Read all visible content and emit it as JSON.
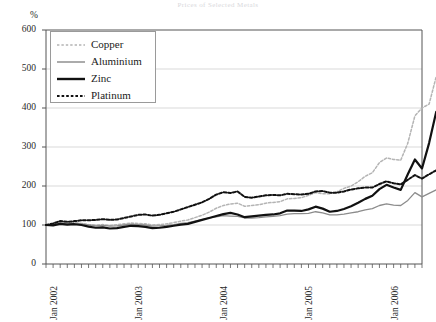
{
  "figure": {
    "title": "Prices of Selected Metals",
    "unit_label": "%"
  },
  "chart_data": {
    "type": "line",
    "title": "Prices of Selected Metals",
    "xlabel": "",
    "ylabel": "%",
    "ylim": [
      0,
      600
    ],
    "yticks": [
      0,
      100,
      200,
      300,
      400,
      500,
      600
    ],
    "ytick_labels": [
      "0",
      "100",
      "200",
      "300",
      "400",
      "500",
      "600"
    ],
    "gridlines": [
      100,
      200,
      300,
      400,
      500
    ],
    "grid": true,
    "legend_position": "upper-left",
    "x_tick_interval_months": 1,
    "x_axis_start": "Jan 2002",
    "x_axis_end": "Jul 2006",
    "xtick_labels": [
      "Jan 2002",
      "Jan 2003",
      "Jan 2004",
      "Jan 2005",
      "Jan 2006"
    ],
    "xtick_label_positions_months": [
      0,
      12,
      24,
      36,
      48
    ],
    "x_months": [
      "Jan 2002",
      "Feb 2002",
      "Mar 2002",
      "Apr 2002",
      "May 2002",
      "Jun 2002",
      "Jul 2002",
      "Aug 2002",
      "Sep 2002",
      "Oct 2002",
      "Nov 2002",
      "Dec 2002",
      "Jan 2003",
      "Feb 2003",
      "Mar 2003",
      "Apr 2003",
      "May 2003",
      "Jun 2003",
      "Jul 2003",
      "Aug 2003",
      "Sep 2003",
      "Oct 2003",
      "Nov 2003",
      "Dec 2003",
      "Jan 2004",
      "Feb 2004",
      "Mar 2004",
      "Apr 2004",
      "May 2004",
      "Jun 2004",
      "Jul 2004",
      "Aug 2004",
      "Sep 2004",
      "Oct 2004",
      "Nov 2004",
      "Dec 2004",
      "Jan 2005",
      "Feb 2005",
      "Mar 2005",
      "Apr 2005",
      "May 2005",
      "Jun 2005",
      "Jul 2005",
      "Aug 2005",
      "Sep 2005",
      "Oct 2005",
      "Nov 2005",
      "Dec 2005",
      "Jan 2006",
      "Feb 2006",
      "Mar 2006",
      "Apr 2006",
      "May 2006",
      "Jun 2006"
    ],
    "series": [
      {
        "name": "Copper",
        "color": "#b4b4b4",
        "style": "dashed",
        "width": 1.5,
        "values": [
          100,
          103,
          107,
          104,
          106,
          104,
          101,
          100,
          101,
          99,
          101,
          103,
          105,
          104,
          103,
          100,
          101,
          103,
          106,
          110,
          113,
          119,
          125,
          133,
          143,
          150,
          154,
          156,
          148,
          150,
          152,
          156,
          158,
          160,
          167,
          168,
          170,
          176,
          183,
          180,
          180,
          185,
          194,
          200,
          211,
          225,
          234,
          260,
          272,
          268,
          266,
          310,
          380,
          400,
          410,
          480
        ]
      },
      {
        "name": "Aluminium",
        "color": "#8c8c8c",
        "style": "solid",
        "width": 1.3,
        "values": [
          100,
          101,
          104,
          103,
          104,
          103,
          100,
          98,
          99,
          97,
          98,
          100,
          102,
          101,
          100,
          97,
          98,
          99,
          101,
          104,
          106,
          110,
          114,
          118,
          121,
          124,
          123,
          122,
          118,
          118,
          119,
          121,
          122,
          124,
          128,
          129,
          129,
          130,
          134,
          131,
          126,
          126,
          128,
          131,
          134,
          139,
          142,
          150,
          154,
          151,
          150,
          163,
          183,
          172,
          181,
          190
        ]
      },
      {
        "name": "Zinc",
        "color": "#111111",
        "style": "solid",
        "width": 2.2,
        "values": [
          100,
          99,
          103,
          101,
          102,
          100,
          96,
          93,
          94,
          91,
          92,
          95,
          98,
          97,
          95,
          92,
          93,
          95,
          98,
          101,
          103,
          108,
          113,
          118,
          123,
          128,
          131,
          127,
          120,
          122,
          124,
          126,
          127,
          130,
          137,
          137,
          136,
          140,
          147,
          142,
          134,
          136,
          141,
          148,
          157,
          167,
          175,
          192,
          203,
          196,
          190,
          230,
          268,
          245,
          310,
          390
        ]
      },
      {
        "name": "Platinum",
        "color": "#111111",
        "style": "dashed",
        "width": 2.0,
        "values": [
          100,
          104,
          110,
          108,
          110,
          112,
          112,
          113,
          115,
          113,
          114,
          118,
          122,
          126,
          127,
          124,
          126,
          130,
          134,
          140,
          146,
          152,
          158,
          167,
          178,
          184,
          182,
          186,
          172,
          170,
          173,
          176,
          177,
          176,
          180,
          179,
          178,
          180,
          186,
          187,
          183,
          183,
          186,
          191,
          194,
          196,
          196,
          205,
          212,
          207,
          204,
          216,
          228,
          219,
          230,
          240
        ]
      }
    ]
  },
  "legend": {
    "items": [
      {
        "label": "Copper"
      },
      {
        "label": "Aluminium"
      },
      {
        "label": "Zinc"
      },
      {
        "label": "Platinum"
      }
    ]
  }
}
